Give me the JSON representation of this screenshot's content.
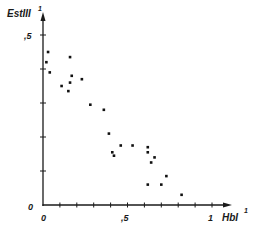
{
  "chart_data": {
    "type": "scatter",
    "title": "",
    "xlabel": "HbI",
    "xlabel_superscript": "1",
    "ylabel": "EstIII",
    "ylabel_superscript": "1",
    "xlim": [
      0,
      1.1
    ],
    "ylim": [
      0,
      0.55
    ],
    "x_ticks": [
      0,
      0.1,
      0.2,
      0.3,
      0.4,
      0.5,
      0.6,
      0.7,
      0.8,
      0.9,
      1.0
    ],
    "x_tick_labels": [
      {
        "value": 0,
        "label": "0"
      },
      {
        "value": 0.5,
        "label": ",5"
      },
      {
        "value": 1,
        "label": "1"
      }
    ],
    "y_ticks": [
      0,
      0.1,
      0.2,
      0.3,
      0.4,
      0.5
    ],
    "y_tick_labels": [
      {
        "value": 0,
        "label": "0"
      },
      {
        "value": 0.5,
        "label": ",5"
      }
    ],
    "grid": false,
    "legend": null,
    "colors": {
      "axis": "#1a1a1a",
      "point": "#111111",
      "background": "#ffffff"
    },
    "series": [
      {
        "name": "EstIII vs HbI",
        "points": [
          [
            0.03,
            0.45
          ],
          [
            0.02,
            0.42
          ],
          [
            0.04,
            0.39
          ],
          [
            0.16,
            0.435
          ],
          [
            0.17,
            0.38
          ],
          [
            0.16,
            0.36
          ],
          [
            0.11,
            0.35
          ],
          [
            0.15,
            0.335
          ],
          [
            0.23,
            0.37
          ],
          [
            0.28,
            0.295
          ],
          [
            0.36,
            0.28
          ],
          [
            0.39,
            0.21
          ],
          [
            0.41,
            0.155
          ],
          [
            0.42,
            0.145
          ],
          [
            0.46,
            0.175
          ],
          [
            0.53,
            0.175
          ],
          [
            0.62,
            0.17
          ],
          [
            0.62,
            0.155
          ],
          [
            0.66,
            0.14
          ],
          [
            0.64,
            0.125
          ],
          [
            0.73,
            0.085
          ],
          [
            0.62,
            0.06
          ],
          [
            0.7,
            0.06
          ],
          [
            0.82,
            0.03
          ]
        ]
      }
    ]
  }
}
